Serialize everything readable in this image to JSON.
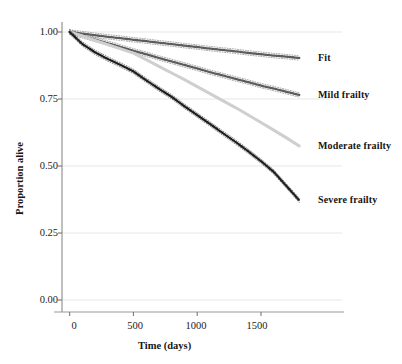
{
  "chart_data": {
    "type": "line",
    "title": "",
    "subtitle": "",
    "xlabel": "Time (days)",
    "ylabel": "Proportion alive",
    "xlim": [
      -60,
      1900
    ],
    "ylim": [
      0.0,
      1.0
    ],
    "xticks": [
      0,
      500,
      1000,
      1500
    ],
    "xtick_labels": [
      "0",
      "500",
      "1000",
      "1500"
    ],
    "yticks": [
      0.0,
      0.25,
      0.5,
      0.75,
      1.0
    ],
    "ytick_labels": [
      "0.00",
      "0.25",
      "0.50",
      "0.75",
      "1.00"
    ],
    "grid": "horizontal",
    "legend_position": "right-inline-labels",
    "annotations": [
      {
        "text": "Fit",
        "x": 1830,
        "y": 0.903
      },
      {
        "text": "Mild frailty",
        "x": 1830,
        "y": 0.765
      },
      {
        "text": "Moderate frailty",
        "x": 1830,
        "y": 0.575
      },
      {
        "text": "Severe frailty",
        "x": 1830,
        "y": 0.372
      }
    ],
    "x": [
      0,
      100,
      200,
      300,
      400,
      500,
      600,
      700,
      800,
      900,
      1000,
      1100,
      1200,
      1300,
      1400,
      1500,
      1600,
      1700,
      1800
    ],
    "series": [
      {
        "name": "Fit",
        "color": "#5c5c5c",
        "style": "dotted-thick",
        "has_confidence_band": true,
        "values": [
          1.0,
          0.994,
          0.988,
          0.982,
          0.977,
          0.971,
          0.966,
          0.96,
          0.955,
          0.949,
          0.944,
          0.938,
          0.933,
          0.928,
          0.922,
          0.917,
          0.912,
          0.908,
          0.903
        ]
      },
      {
        "name": "Mild frailty",
        "color": "#5c5c5c",
        "style": "dotted-thick",
        "has_confidence_band": true,
        "values": [
          1.0,
          0.986,
          0.972,
          0.958,
          0.944,
          0.93,
          0.917,
          0.903,
          0.89,
          0.877,
          0.864,
          0.85,
          0.838,
          0.825,
          0.813,
          0.8,
          0.789,
          0.777,
          0.765
        ]
      },
      {
        "name": "Moderate frailty",
        "color": "#cfcfcf",
        "style": "solid-thick",
        "has_confidence_band": false,
        "values": [
          1.0,
          0.985,
          0.969,
          0.953,
          0.937,
          0.921,
          0.897,
          0.872,
          0.847,
          0.822,
          0.796,
          0.77,
          0.744,
          0.718,
          0.69,
          0.662,
          0.634,
          0.605,
          0.575
        ]
      },
      {
        "name": "Severe frailty",
        "color": "#1f1f1f",
        "style": "dotted-thick",
        "has_confidence_band": true,
        "values": [
          1.0,
          0.955,
          0.924,
          0.899,
          0.877,
          0.853,
          0.82,
          0.788,
          0.758,
          0.723,
          0.69,
          0.657,
          0.623,
          0.59,
          0.555,
          0.518,
          0.478,
          0.425,
          0.372
        ]
      }
    ]
  }
}
